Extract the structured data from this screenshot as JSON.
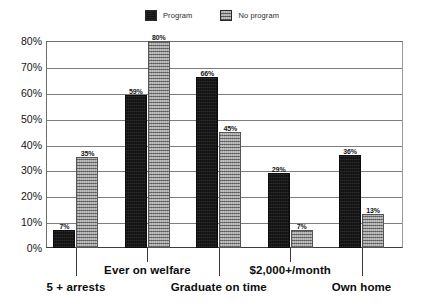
{
  "legend": {
    "entries": [
      {
        "label": "Program",
        "swatch": "solid-black-swatch",
        "color": "#1b1b1b"
      },
      {
        "label": "No program",
        "swatch": "gray-hatched-swatch",
        "color": "#979797"
      }
    ]
  },
  "axis": {
    "y_ticks": [
      "0%",
      "10%",
      "20%",
      "30%",
      "40%",
      "50%",
      "60%",
      "70%",
      "80%"
    ]
  },
  "chart_data": {
    "type": "bar",
    "title": "",
    "subtitle": "",
    "xlabel": "",
    "ylabel": "",
    "ylim": [
      0,
      80
    ],
    "ytick_step": 10,
    "ytick_format": "percent",
    "grid": true,
    "legend_position": "top-center",
    "orientation": "vertical",
    "grouping": "clustered",
    "categories": [
      "5 + arrests",
      "Ever on welfare",
      "Graduate on time",
      "$2,000+/month",
      "Own home"
    ],
    "series": [
      {
        "name": "Program",
        "color": "#1b1b1b",
        "values": [
          7,
          59,
          66,
          29,
          36
        ],
        "labels": [
          "7%",
          "59%",
          "66%",
          "29%",
          "36%"
        ]
      },
      {
        "name": "No program",
        "color": "#979797",
        "values": [
          35,
          80,
          45,
          7,
          13
        ],
        "labels": [
          "35%",
          "80%",
          "45%",
          "7%",
          "13%"
        ]
      }
    ]
  }
}
